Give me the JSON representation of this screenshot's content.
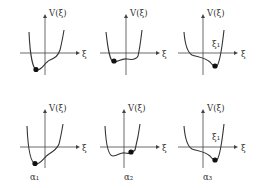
{
  "figure": {
    "y_axis_label": "V(ξ)",
    "x_axis_label": "ξ",
    "marker_label": "ξ₁",
    "panels": [
      {
        "row": 1,
        "col": 1,
        "label": ""
      },
      {
        "row": 1,
        "col": 2,
        "label": ""
      },
      {
        "row": 1,
        "col": 3,
        "label": "",
        "marker": "ξ₁"
      },
      {
        "row": 2,
        "col": 1,
        "label": "α₁"
      },
      {
        "row": 2,
        "col": 2,
        "label": "α₂"
      },
      {
        "row": 2,
        "col": 3,
        "label": "α₃",
        "marker": "ξ₁"
      }
    ],
    "bottom_labels": [
      "α₁",
      "α₂",
      "α₃"
    ]
  }
}
